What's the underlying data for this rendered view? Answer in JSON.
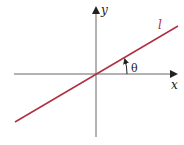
{
  "diagram": {
    "axes": {
      "x_label": "x",
      "y_label": "y"
    },
    "line": {
      "label": "l",
      "color": "#b03040"
    },
    "angle": {
      "label": "θ"
    },
    "axis_color": "#555555"
  }
}
